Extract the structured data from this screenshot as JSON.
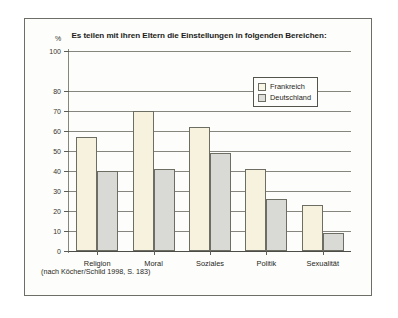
{
  "figure": {
    "title": "Es teilen mit ihren Eltern die Einstellungen in folgenden Bereichen:",
    "unit_label": "%",
    "source_note": "(nach Köcher/Schild 1998, S. 183)"
  },
  "legend": {
    "items": [
      {
        "label": "Frankreich",
        "color": "#f8f6e6"
      },
      {
        "label": "Deutschland",
        "color": "#dededb"
      }
    ]
  },
  "chart_data": {
    "type": "bar",
    "title": "Es teilen mit ihren Eltern die Einstellungen in folgenden Bereichen:",
    "xlabel": "",
    "ylabel": "%",
    "ylim": [
      0,
      100
    ],
    "yticks": [
      0,
      10,
      20,
      30,
      40,
      50,
      60,
      70,
      80,
      100
    ],
    "ytick_labels": [
      "0",
      "10",
      "20",
      "30",
      "40",
      "50",
      "60",
      "70",
      "80",
      "100"
    ],
    "grid": true,
    "legend_position": "upper right",
    "categories": [
      "Religion",
      "Moral",
      "Soziales",
      "Politik",
      "Sexualität"
    ],
    "series": [
      {
        "name": "Frankreich",
        "color": "#f6f2dd",
        "values": [
          57,
          70,
          62,
          41,
          23
        ]
      },
      {
        "name": "Deutschland",
        "color": "#d9d9d6",
        "values": [
          40,
          41,
          49,
          26,
          9
        ]
      }
    ],
    "annotation": "(nach Köcher/Schild 1998, S. 183)"
  }
}
